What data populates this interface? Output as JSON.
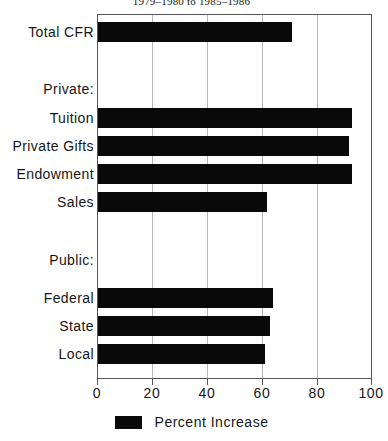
{
  "chart_data": {
    "type": "bar",
    "orientation": "horizontal",
    "title": "1979–1980 to 1985–1986",
    "xlabel": "",
    "ylabel": "",
    "xlim": [
      0,
      100
    ],
    "xticks": [
      "0",
      "20",
      "40",
      "60",
      "80",
      "100"
    ],
    "xtick_values": [
      0,
      20,
      40,
      60,
      80,
      100
    ],
    "grid": true,
    "legend": {
      "position": "bottom-center",
      "entries": [
        {
          "label": "Percent Increase",
          "color": "#0a0a0a",
          "swatch": "filled-rect"
        }
      ]
    },
    "categories": [
      "Total CFR",
      "Private:",
      "Tuition",
      "Private Gifts",
      "Endowment",
      "Sales",
      "Public:",
      "Federal",
      "State",
      "Local"
    ],
    "rows": [
      {
        "label": "Total CFR",
        "value": 71,
        "is_header": false
      },
      {
        "label": "Private:",
        "value": null,
        "is_header": true
      },
      {
        "label": "Tuition",
        "value": 93,
        "is_header": false
      },
      {
        "label": "Private Gifts",
        "value": 92,
        "is_header": false
      },
      {
        "label": "Endowment",
        "value": 93,
        "is_header": false
      },
      {
        "label": "Sales",
        "value": 62,
        "is_header": false
      },
      {
        "label": "Public:",
        "value": null,
        "is_header": true
      },
      {
        "label": "Federal",
        "value": 64,
        "is_header": false
      },
      {
        "label": "State",
        "value": 63,
        "is_header": false
      },
      {
        "label": "Local",
        "value": 61,
        "is_header": false
      }
    ],
    "series": [
      {
        "name": "Percent Increase",
        "color": "#0a0a0a",
        "values": [
          71,
          null,
          93,
          92,
          93,
          62,
          null,
          64,
          63,
          61
        ]
      }
    ]
  },
  "labels": {
    "total_cfr": "Total CFR",
    "private_header": "Private:",
    "tuition": "Tuition",
    "private_gifts": "Private Gifts",
    "endowment": "Endowment",
    "sales": "Sales",
    "public_header": "Public:",
    "federal": "Federal",
    "state": "State",
    "local": "Local"
  },
  "axis": {
    "t0": "0",
    "t20": "20",
    "t40": "40",
    "t60": "60",
    "t80": "80",
    "t100": "100"
  },
  "legend": {
    "label": "Percent Increase"
  },
  "colors": {
    "bar": "#0a0a0a",
    "frame": "#58585a",
    "grid": "#b9b9bb",
    "text": "#161616",
    "background": "#ffffff"
  }
}
